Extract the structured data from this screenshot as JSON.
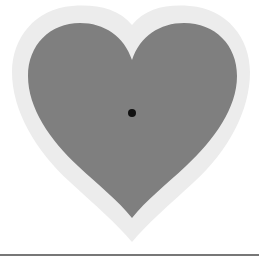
{
  "figure": {
    "colors": {
      "background": "#ffffff",
      "halo": "#ececec",
      "heart": "#7f7f7f",
      "dot": "#111111",
      "baseline": "#777777"
    },
    "dot": {
      "cx": 132,
      "cy": 113,
      "r": 4
    }
  }
}
